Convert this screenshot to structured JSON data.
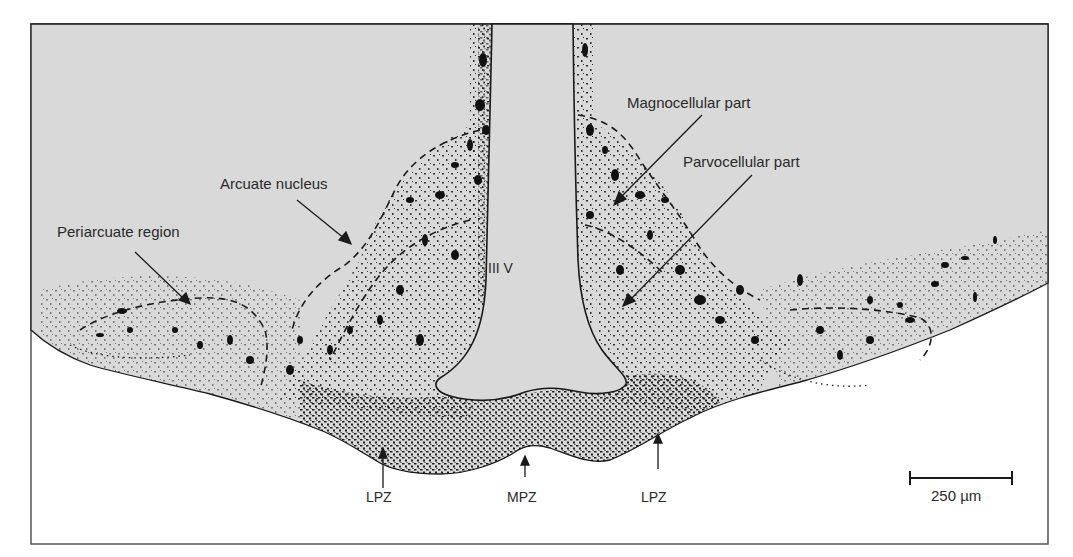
{
  "figure": {
    "type": "histological line drawing (coronal section of mediobasal hypothalamus)",
    "colors": {
      "tissue_fill": "#d9d9d9",
      "background": "#ffffff",
      "ink": "#1a1a1a",
      "frame": "#555555"
    },
    "labels": {
      "ventricle": "III V",
      "arcuate_nucleus": "Arcuate nucleus",
      "periarcuate_region": "Periarcuate region",
      "magnocellular_part": "Magnocellular part",
      "parvocellular_part": "Parvocellular part",
      "lpz_left": "LPZ",
      "mpz": "MPZ",
      "lpz_right": "LPZ"
    },
    "scale_bar": {
      "label": "250 µm",
      "value": 250,
      "unit": "µm"
    }
  }
}
